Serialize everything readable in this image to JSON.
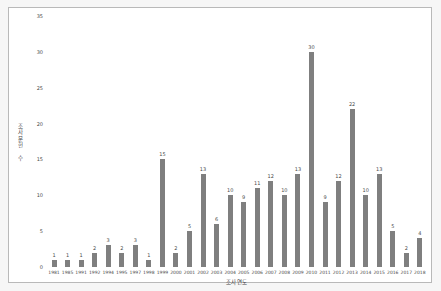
{
  "figure": {
    "background": "#ffffff",
    "border_color": "#b9b9b9"
  },
  "chart_data": {
    "type": "bar",
    "title": "",
    "xlabel": "조사연도",
    "ylabel": "조사문헌 수",
    "categories": [
      "1981",
      "1985",
      "1991",
      "1992",
      "1994",
      "1995",
      "1997",
      "1998",
      "1999",
      "2000",
      "2001",
      "2002",
      "2003",
      "2004",
      "2005",
      "2006",
      "2007",
      "2008",
      "2009",
      "2010",
      "2011",
      "2012",
      "2013",
      "2014",
      "2015",
      "2016",
      "2017",
      "2018"
    ],
    "values": [
      1,
      1,
      1,
      2,
      3,
      2,
      3,
      1,
      15,
      2,
      5,
      13,
      6,
      10,
      9,
      11,
      12,
      10,
      13,
      30,
      9,
      12,
      22,
      10,
      13,
      5,
      2,
      4
    ],
    "ylim": [
      0,
      35
    ],
    "yticks": [
      0,
      5,
      10,
      15,
      20,
      25,
      30,
      35
    ],
    "bar_color": "#7f7f7f",
    "value_label_color": "#4a4a4a",
    "grid": false,
    "legend": null,
    "value_labels_shown": true
  }
}
